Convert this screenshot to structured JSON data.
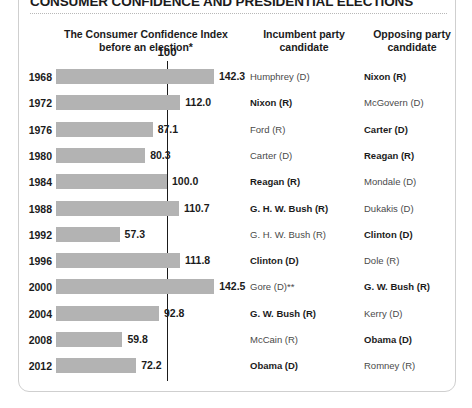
{
  "title": "CONSUMER CONFIDENCE AND PRESIDENTIAL ELECTIONS",
  "headers": {
    "index": "The Consumer Confidence Index\nbefore an election*",
    "index_line1": "The Consumer Confidence Index",
    "index_line2": "before an election*",
    "incumbent_line1": "Incumbent party",
    "incumbent_line2": "candidate",
    "opposing_line1": "Opposing party",
    "opposing_line2": "candidate"
  },
  "reference_line": {
    "label": "100",
    "value": 100
  },
  "colors": {
    "bar": "#b3b3b3",
    "reference_line": "#1b1b1b",
    "text": "#1b1b1b",
    "muted_text": "#4a4a4a",
    "card_border": "#cfcfcf"
  },
  "chart_data": {
    "type": "bar",
    "title": "CONSUMER CONFIDENCE AND PRESIDENTIAL ELECTIONS",
    "xlabel": "",
    "ylabel": "",
    "orientation": "horizontal",
    "grid": false,
    "legend": false,
    "xlim": [
      0,
      150
    ],
    "reference_value": 100,
    "categories": [
      "1968",
      "1972",
      "1976",
      "1980",
      "1984",
      "1988",
      "1992",
      "1996",
      "2000",
      "2004",
      "2008",
      "2012"
    ],
    "values": [
      142.3,
      112.0,
      87.1,
      80.3,
      100.0,
      110.7,
      57.3,
      111.8,
      142.5,
      92.8,
      59.8,
      72.2
    ],
    "value_labels": [
      "142.3",
      "112.0",
      "87.1",
      "80.3",
      "100.0",
      "110.7",
      "57.3",
      "111.8",
      "142.5",
      "92.8",
      "59.8",
      "72.2"
    ]
  },
  "rows": [
    {
      "year": "1968",
      "value": 142.3,
      "value_label": "142.3",
      "incumbent": "Humphrey (D)",
      "incumbent_winner": false,
      "opposing": "Nixon (R)",
      "opposing_winner": true
    },
    {
      "year": "1972",
      "value": 112.0,
      "value_label": "112.0",
      "incumbent": "Nixon (R)",
      "incumbent_winner": true,
      "opposing": "McGovern (D)",
      "opposing_winner": false
    },
    {
      "year": "1976",
      "value": 87.1,
      "value_label": "87.1",
      "incumbent": "Ford (R)",
      "incumbent_winner": false,
      "opposing": "Carter (D)",
      "opposing_winner": true
    },
    {
      "year": "1980",
      "value": 80.3,
      "value_label": "80.3",
      "incumbent": "Carter (D)",
      "incumbent_winner": false,
      "opposing": "Reagan (R)",
      "opposing_winner": true
    },
    {
      "year": "1984",
      "value": 100.0,
      "value_label": "100.0",
      "incumbent": "Reagan (R)",
      "incumbent_winner": true,
      "opposing": "Mondale (D)",
      "opposing_winner": false
    },
    {
      "year": "1988",
      "value": 110.7,
      "value_label": "110.7",
      "incumbent": "G. H. W. Bush (R)",
      "incumbent_winner": true,
      "opposing": "Dukakis (D)",
      "opposing_winner": false
    },
    {
      "year": "1992",
      "value": 57.3,
      "value_label": "57.3",
      "incumbent": "G. H. W. Bush (R)",
      "incumbent_winner": false,
      "opposing": "Clinton (D)",
      "opposing_winner": true
    },
    {
      "year": "1996",
      "value": 111.8,
      "value_label": "111.8",
      "incumbent": "Clinton (D)",
      "incumbent_winner": true,
      "opposing": "Dole (R)",
      "opposing_winner": false
    },
    {
      "year": "2000",
      "value": 142.5,
      "value_label": "142.5",
      "incumbent": "Gore (D)**",
      "incumbent_winner": false,
      "opposing": "G. W. Bush (R)",
      "opposing_winner": true
    },
    {
      "year": "2004",
      "value": 92.8,
      "value_label": "92.8",
      "incumbent": "G. W. Bush (R)",
      "incumbent_winner": true,
      "opposing": "Kerry (D)",
      "opposing_winner": false
    },
    {
      "year": "2008",
      "value": 59.8,
      "value_label": "59.8",
      "incumbent": "McCain (R)",
      "incumbent_winner": false,
      "opposing": "Obama (D)",
      "opposing_winner": true
    },
    {
      "year": "2012",
      "value": 72.2,
      "value_label": "72.2",
      "incumbent": "Obama (D)",
      "incumbent_winner": true,
      "opposing": "Romney (R)",
      "opposing_winner": false
    }
  ]
}
